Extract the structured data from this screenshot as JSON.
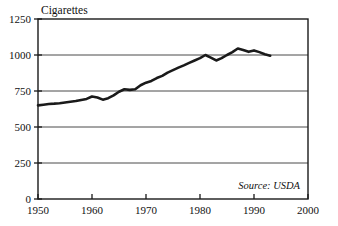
{
  "chart_data": {
    "type": "line",
    "title": "Cigarettes",
    "xlabel": "",
    "ylabel": "",
    "xlim": [
      1950,
      2000
    ],
    "ylim": [
      0,
      1250
    ],
    "grid": true,
    "legend": "none",
    "annotation": "Source: USDA",
    "y_ticks": [
      0,
      250,
      500,
      750,
      1000,
      1250
    ],
    "y_tick_labels": [
      "0",
      "250",
      "500",
      "750",
      "1000",
      "1250"
    ],
    "x_ticks": [
      1950,
      1960,
      1970,
      1980,
      1990,
      2000
    ],
    "x_tick_labels": [
      "1950",
      "1960",
      "1970",
      "1980",
      "1990",
      "2000"
    ],
    "series": [
      {
        "name": "Cigarettes per capita",
        "color": "#1a1a1a",
        "x": [
          1950,
          1951,
          1952,
          1953,
          1954,
          1955,
          1956,
          1957,
          1958,
          1959,
          1960,
          1961,
          1962,
          1963,
          1964,
          1965,
          1966,
          1967,
          1968,
          1969,
          1970,
          1971,
          1972,
          1973,
          1974,
          1975,
          1976,
          1977,
          1978,
          1979,
          1980,
          1981,
          1982,
          1983,
          1984,
          1985,
          1986,
          1987,
          1988,
          1989,
          1990,
          1991,
          1992,
          1993
        ],
        "values": [
          650,
          655,
          660,
          662,
          665,
          670,
          675,
          680,
          688,
          695,
          712,
          705,
          690,
          700,
          720,
          745,
          762,
          758,
          762,
          790,
          808,
          820,
          840,
          855,
          878,
          895,
          912,
          928,
          945,
          962,
          978,
          1000,
          982,
          962,
          978,
          1000,
          1020,
          1045,
          1035,
          1022,
          1032,
          1020,
          1005,
          995
        ]
      }
    ]
  },
  "figure": {
    "plot_background": "#ffffff",
    "axis_color": "#1a1a1a",
    "grid_color": "#4a4a4a",
    "line_color": "#1a1a1a"
  }
}
